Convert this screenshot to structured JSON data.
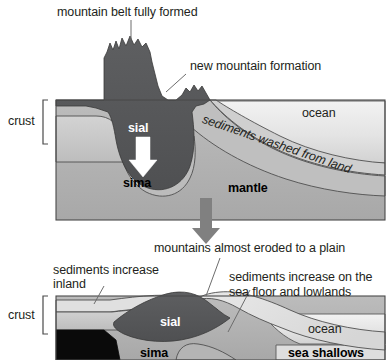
{
  "figure": {
    "title_top": "mountain belt fully formed",
    "title_mid": "mountains almost eroded to a plain"
  },
  "panel_top": {
    "labels": {
      "mountain_belt": "mountain belt fully formed",
      "new_mountain": "new mountain formation",
      "crust": "crust",
      "sial": "sial",
      "sima": "sima",
      "mantle": "mantle",
      "ocean": "ocean",
      "sediments_washed": "sediments washed from land"
    }
  },
  "panel_bottom": {
    "labels": {
      "eroded_plain": "mountains almost eroded to a plain",
      "sediments_inland": "sediments increase\ninland",
      "sediments_inland_l1": "sediments increase",
      "sediments_inland_l2": "inland",
      "sediments_sea_l1": "sediments increase on the",
      "sediments_sea_l2": "sea floor and lowlands",
      "crust": "crust",
      "sial": "sial",
      "sima": "sima",
      "ocean": "ocean",
      "sea_shallows": "sea shallows"
    }
  },
  "colors": {
    "background": "#ffffff",
    "sial_dark": "#58595b",
    "mantle_gray": "#b0b0b0",
    "crust_light": "#c9c9c9",
    "sediment_pale": "#dcdcdc",
    "ocean_pale": "#e3e3e3",
    "black_wedge": "#000000",
    "outline": "#3a3a3a",
    "text": "#231f20",
    "arrow_gray": "#7b7b7b",
    "arrow_white": "#ffffff"
  },
  "icons": {
    "down_arrow_white": "white-down-arrow",
    "down_arrow_gray": "gray-down-arrow",
    "crust_bracket": "crust-bracket"
  }
}
